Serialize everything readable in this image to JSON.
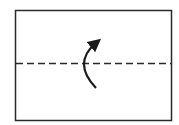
{
  "diagram": {
    "type": "fold-instruction",
    "paper": {
      "x": 15,
      "y": 10,
      "width": 156,
      "height": 110,
      "stroke": "#2a2a2a"
    },
    "fold_line": {
      "style": "valley-dashed",
      "y": 63,
      "stroke": "#2a2a2a"
    },
    "arrow": {
      "direction": "fold-up",
      "stroke": "#1a1a1a"
    }
  }
}
